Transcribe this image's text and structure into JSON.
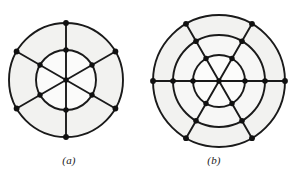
{
  "figure_set": {
    "background_color": "#ffffff",
    "stroke_color": "#1a1a1a",
    "fill_color": "#f2f2f0",
    "node_color": "#111111",
    "panels": [
      {
        "id": "a",
        "caption": "(a)",
        "description": "Wheel-like planar graph: two concentric circles with six radial spokes",
        "center": {
          "x": 66,
          "y": 80
        },
        "rings": [
          30,
          57
        ],
        "spoke_count": 6,
        "spoke_angles_deg": [
          30,
          90,
          150,
          210,
          270,
          330
        ],
        "node_count": 13,
        "nodes": [
          {
            "ring": 0,
            "angle": 0,
            "x": 66,
            "y": 80
          },
          {
            "ring": 1,
            "angle": 30,
            "x": 92,
            "y": 95
          },
          {
            "ring": 1,
            "angle": 90,
            "x": 66,
            "y": 110
          },
          {
            "ring": 1,
            "angle": 150,
            "x": 40,
            "y": 95
          },
          {
            "ring": 1,
            "angle": 210,
            "x": 40,
            "y": 65
          },
          {
            "ring": 1,
            "angle": 270,
            "x": 66,
            "y": 50
          },
          {
            "ring": 1,
            "angle": 330,
            "x": 92,
            "y": 65
          },
          {
            "ring": 2,
            "angle": 30,
            "x": 115,
            "y": 109
          },
          {
            "ring": 2,
            "angle": 90,
            "x": 66,
            "y": 137
          },
          {
            "ring": 2,
            "angle": 150,
            "x": 17,
            "y": 109
          },
          {
            "ring": 2,
            "angle": 210,
            "x": 17,
            "y": 52
          },
          {
            "ring": 2,
            "angle": 270,
            "x": 66,
            "y": 23
          },
          {
            "ring": 2,
            "angle": 330,
            "x": 115,
            "y": 52
          }
        ]
      },
      {
        "id": "b",
        "caption": "(b)",
        "description": "Wheel-like planar graph: three concentric circles with six radial spokes",
        "center": {
          "x": 219,
          "y": 81
        },
        "rings": [
          26,
          46,
          66
        ],
        "spoke_count": 6,
        "spoke_angles_deg": [
          0,
          60,
          120,
          180,
          240,
          300
        ],
        "node_count": 19,
        "nodes": [
          {
            "ring": 0,
            "angle": 0,
            "x": 219,
            "y": 81
          },
          {
            "ring": 1,
            "angle": 0,
            "x": 245,
            "y": 81
          },
          {
            "ring": 1,
            "angle": 60,
            "x": 232,
            "y": 104
          },
          {
            "ring": 1,
            "angle": 120,
            "x": 206,
            "y": 104
          },
          {
            "ring": 1,
            "angle": 180,
            "x": 193,
            "y": 81
          },
          {
            "ring": 1,
            "angle": 240,
            "x": 206,
            "y": 59
          },
          {
            "ring": 1,
            "angle": 300,
            "x": 232,
            "y": 59
          },
          {
            "ring": 2,
            "angle": 0,
            "x": 265,
            "y": 81
          },
          {
            "ring": 2,
            "angle": 60,
            "x": 242,
            "y": 121
          },
          {
            "ring": 2,
            "angle": 120,
            "x": 196,
            "y": 121
          },
          {
            "ring": 2,
            "angle": 180,
            "x": 173,
            "y": 81
          },
          {
            "ring": 2,
            "angle": 240,
            "x": 196,
            "y": 41
          },
          {
            "ring": 2,
            "angle": 300,
            "x": 242,
            "y": 41
          },
          {
            "ring": 3,
            "angle": 0,
            "x": 285,
            "y": 81
          },
          {
            "ring": 3,
            "angle": 60,
            "x": 252,
            "y": 138
          },
          {
            "ring": 3,
            "angle": 120,
            "x": 186,
            "y": 138
          },
          {
            "ring": 3,
            "angle": 180,
            "x": 153,
            "y": 81
          },
          {
            "ring": 3,
            "angle": 240,
            "x": 186,
            "y": 24
          },
          {
            "ring": 3,
            "angle": 300,
            "x": 252,
            "y": 24
          }
        ]
      }
    ]
  }
}
